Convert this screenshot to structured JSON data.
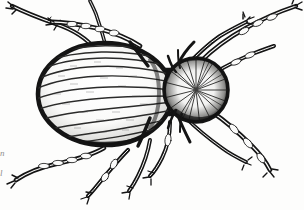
{
  "figure": {
    "title": "Engraved line illustration of a mite / beetle-like arachnid, dorsal view",
    "medium": "ink engraving, black on off-white paper",
    "orientation": "dorsal view, head to the right",
    "background_color": "#fdfdfc",
    "ink_color": "#151515"
  },
  "margin_notes": {
    "line_1": "n",
    "line_2": "l"
  },
  "anatomy": {
    "abdomen": {
      "label": "abdomen",
      "shape": "large ovate body",
      "center_x": 105,
      "center_y": 94,
      "radius_x": 68,
      "radius_y": 52,
      "striation_count": 11,
      "outline_weight_px": 4,
      "shading": "heavy stipple along left and lower margin, pale centre"
    },
    "thorax": {
      "label": "thorax",
      "shape": "narrow dark waist segment",
      "center_x": 163,
      "center_y": 92,
      "width": 22,
      "height": 42
    },
    "head": {
      "label": "head / gnathosoma",
      "shape": "round, densely bristled disc",
      "center_x": 196,
      "center_y": 90,
      "radius": 33,
      "texture": "radiating fine hairs, dark rim"
    },
    "legs": [
      {
        "id": 1,
        "label": "left foreleg",
        "side": "left",
        "position": "anterior",
        "segments": 4
      },
      {
        "id": 2,
        "label": "left midleg",
        "side": "left",
        "position": "median",
        "segments": 4
      },
      {
        "id": 3,
        "label": "left hindleg",
        "side": "left",
        "position": "posterior",
        "segments": 4
      },
      {
        "id": 4,
        "label": "left rear hindleg",
        "side": "left",
        "position": "posterior-lower",
        "segments": 4
      },
      {
        "id": 5,
        "label": "right foreleg upper",
        "side": "right",
        "position": "anterior",
        "segments": 4
      },
      {
        "id": 6,
        "label": "right foreleg",
        "side": "right",
        "position": "anterior-lower",
        "segments": 4
      },
      {
        "id": 7,
        "label": "right midleg",
        "side": "right",
        "position": "median",
        "segments": 4
      },
      {
        "id": 8,
        "label": "right hindleg",
        "side": "right",
        "position": "posterior",
        "segments": 4
      }
    ],
    "leg_count_visible": 8
  }
}
